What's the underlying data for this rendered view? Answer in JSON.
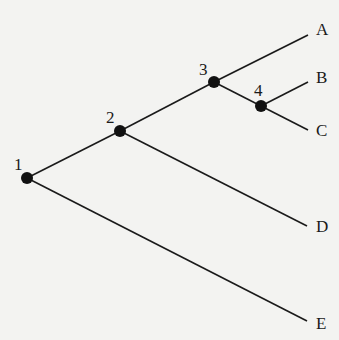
{
  "diagram": {
    "type": "phylogenetic-tree",
    "internal_nodes": [
      {
        "id": "1",
        "label": "1",
        "x": 27,
        "y": 178,
        "lx": 14,
        "ly": 170
      },
      {
        "id": "2",
        "label": "2",
        "x": 120,
        "y": 131,
        "lx": 106,
        "ly": 123
      },
      {
        "id": "3",
        "label": "3",
        "x": 214,
        "y": 82,
        "lx": 199,
        "ly": 75
      },
      {
        "id": "4",
        "label": "4",
        "x": 261,
        "y": 106,
        "lx": 254,
        "ly": 96
      }
    ],
    "leaves": [
      {
        "id": "A",
        "label": "A",
        "x": 308,
        "y": 35,
        "lx": 316,
        "ly": 35
      },
      {
        "id": "B",
        "label": "B",
        "x": 308,
        "y": 82,
        "lx": 316,
        "ly": 83
      },
      {
        "id": "C",
        "label": "C",
        "x": 308,
        "y": 130,
        "lx": 316,
        "ly": 136
      },
      {
        "id": "D",
        "label": "D",
        "x": 307,
        "y": 226,
        "lx": 316,
        "ly": 232
      },
      {
        "id": "E",
        "label": "E",
        "x": 307,
        "y": 321,
        "lx": 316,
        "ly": 329
      }
    ],
    "edges": [
      [
        "1",
        "2"
      ],
      [
        "1",
        "E"
      ],
      [
        "2",
        "3"
      ],
      [
        "2",
        "D"
      ],
      [
        "3",
        "A"
      ],
      [
        "3",
        "4"
      ],
      [
        "4",
        "B"
      ],
      [
        "4",
        "C"
      ]
    ]
  }
}
